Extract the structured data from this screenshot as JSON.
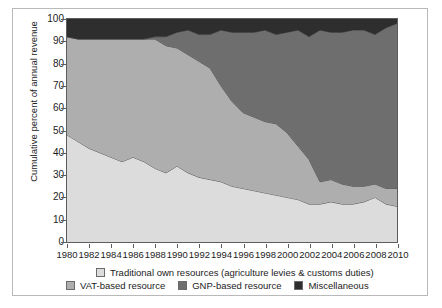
{
  "chart_data": {
    "type": "area",
    "stacked": true,
    "title": "",
    "subtitle": "",
    "xlabel": "",
    "ylabel": "Cumulative percent of annual revenue",
    "xlim": [
      1980,
      2010
    ],
    "ylim": [
      0,
      100
    ],
    "grid": false,
    "legend_position": "bottom",
    "x": [
      1980,
      1981,
      1982,
      1983,
      1984,
      1985,
      1986,
      1987,
      1988,
      1989,
      1990,
      1991,
      1992,
      1993,
      1994,
      1995,
      1996,
      1997,
      1998,
      1999,
      2000,
      2001,
      2002,
      2003,
      2004,
      2005,
      2006,
      2007,
      2008,
      2009,
      2010
    ],
    "xticks": [
      1980,
      1982,
      1984,
      1986,
      1988,
      1990,
      1992,
      1994,
      1996,
      1998,
      2000,
      2002,
      2004,
      2006,
      2008,
      2010
    ],
    "xticklabels": [
      "1980",
      "1982",
      "1984",
      "1986",
      "1988",
      "1990",
      "1992",
      "1994",
      "1996",
      "1998",
      "2000",
      "2002",
      "2004",
      "2006",
      "2008",
      "2010"
    ],
    "yticks": [
      0,
      10,
      20,
      30,
      40,
      50,
      60,
      70,
      80,
      90,
      100
    ],
    "yticklabels": [
      "0",
      "10",
      "20",
      "30",
      "40",
      "50",
      "60",
      "70",
      "80",
      "90",
      "100"
    ],
    "series": [
      {
        "name": "Traditional own resources (agriculture levies & customs duties)",
        "color": "#dcdcdc",
        "values": [
          48,
          45,
          42,
          40,
          38,
          36,
          38,
          36,
          33,
          31,
          34,
          31,
          29,
          28,
          27,
          25,
          24,
          23,
          22,
          21,
          20,
          19,
          17,
          17,
          18,
          17,
          17,
          18,
          20,
          17,
          16
        ]
      },
      {
        "name": "VAT-based resource",
        "color": "#aeaeae",
        "values": [
          44,
          46,
          49,
          51,
          53,
          55,
          53,
          55,
          58,
          57,
          53,
          53,
          52,
          50,
          43,
          38,
          34,
          33,
          32,
          32,
          29,
          24,
          20,
          10,
          10,
          9,
          8,
          7,
          6,
          7,
          8
        ]
      },
      {
        "name": "GNP-based resource",
        "color": "#6e6e6e",
        "values": [
          0,
          0,
          0,
          0,
          0,
          0,
          0,
          0,
          1,
          4,
          7,
          11,
          12,
          15,
          25,
          31,
          36,
          38,
          41,
          40,
          45,
          52,
          55,
          68,
          66,
          68,
          70,
          70,
          67,
          72,
          74
        ]
      },
      {
        "name": "Miscellaneous",
        "color": "#2e2e2e",
        "values": [
          8,
          9,
          9,
          9,
          9,
          9,
          9,
          9,
          8,
          8,
          6,
          5,
          7,
          7,
          5,
          6,
          6,
          6,
          5,
          7,
          6,
          5,
          8,
          5,
          6,
          6,
          5,
          5,
          7,
          4,
          2
        ]
      }
    ],
    "cumulative_bounds": {
      "note": "Upper boundary of each stacked band, in percent of annual revenue",
      "traditional_top": [
        48,
        45,
        42,
        40,
        38,
        36,
        38,
        36,
        33,
        31,
        34,
        31,
        29,
        28,
        27,
        25,
        24,
        23,
        22,
        21,
        20,
        19,
        17,
        17,
        18,
        17,
        17,
        18,
        20,
        17,
        16
      ],
      "vat_top": [
        92,
        91,
        91,
        91,
        91,
        91,
        91,
        91,
        91,
        88,
        87,
        84,
        81,
        78,
        70,
        63,
        58,
        56,
        54,
        53,
        49,
        43,
        37,
        27,
        28,
        26,
        25,
        25,
        26,
        24,
        24
      ],
      "gnp_top": [
        92,
        91,
        91,
        91,
        91,
        91,
        91,
        91,
        92,
        92,
        94,
        95,
        93,
        93,
        95,
        94,
        94,
        94,
        95,
        93,
        94,
        95,
        92,
        95,
        94,
        94,
        95,
        95,
        93,
        96,
        98
      ],
      "misc_top": [
        100,
        100,
        100,
        100,
        100,
        100,
        100,
        100,
        100,
        100,
        100,
        100,
        100,
        100,
        100,
        100,
        100,
        100,
        100,
        100,
        100,
        100,
        100,
        100,
        100,
        100,
        100,
        100,
        100,
        100,
        100
      ]
    }
  },
  "legend": {
    "items": [
      {
        "label": "Traditional own resources (agriculture levies & customs duties)",
        "color": "#dcdcdc"
      },
      {
        "label": "VAT-based resource",
        "color": "#aeaeae"
      },
      {
        "label": "GNP-based resource",
        "color": "#6e6e6e"
      },
      {
        "label": "Miscellaneous",
        "color": "#2e2e2e"
      }
    ]
  },
  "axes": {
    "y_title": "Cumulative percent of annual revenue"
  }
}
